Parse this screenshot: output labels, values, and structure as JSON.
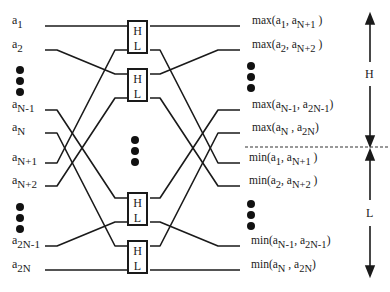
{
  "inputs": [
    {
      "base": "a",
      "sub": "1",
      "y": 26
    },
    {
      "base": "a",
      "sub": "2",
      "y": 50
    },
    {
      "base": "a",
      "sub": "N-1",
      "y": 110
    },
    {
      "base": "a",
      "sub": "N",
      "y": 133
    },
    {
      "base": "a",
      "sub": "N+1",
      "y": 163
    },
    {
      "base": "a",
      "sub": "N+2",
      "y": 186
    },
    {
      "base": "a",
      "sub": "2N-1",
      "y": 246
    },
    {
      "base": "a",
      "sub": "2N",
      "y": 270
    }
  ],
  "boxes": [
    {
      "high": "H",
      "low": "L",
      "top": 20
    },
    {
      "high": "H",
      "low": "L",
      "top": 68
    },
    {
      "high": "H",
      "low": "L",
      "top": 192
    },
    {
      "high": "H",
      "low": "L",
      "top": 240
    }
  ],
  "outputs": [
    {
      "fn": "max",
      "a": "1",
      "b": "N+1",
      "y": 26
    },
    {
      "fn": "max",
      "a": "2",
      "b": "N+2",
      "y": 50
    },
    {
      "fn": "max",
      "a": "N-1",
      "b": "2N-1",
      "y": 110
    },
    {
      "fn": "max",
      "a": "N",
      "b": "2N",
      "y": 133
    },
    {
      "fn": "min",
      "a": "1",
      "b": "N+1",
      "y": 163
    },
    {
      "fn": "min",
      "a": "2",
      "b": "N+2",
      "y": 186
    },
    {
      "fn": "min",
      "a": "N-1",
      "b": "2N-1",
      "y": 246
    },
    {
      "fn": "min",
      "a": "N",
      "b": "2N",
      "y": 270
    }
  ],
  "side_labels": {
    "high": "H",
    "low": "L"
  },
  "colors": {
    "line": "#1a1a1a",
    "dash": "#333333"
  }
}
